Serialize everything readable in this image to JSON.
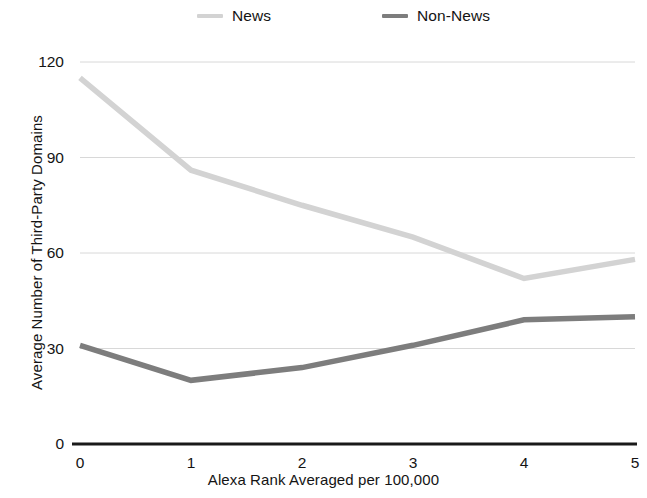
{
  "chart_data": {
    "type": "line",
    "title": "",
    "xlabel": "Alexa Rank Averaged per 100,000",
    "ylabel": "Average Number of Third-Party Domains",
    "x": [
      0,
      1,
      2,
      3,
      4,
      5
    ],
    "xticklabels": [
      "0",
      "1",
      "2",
      "3",
      "4",
      "5"
    ],
    "yticks": [
      0,
      30,
      60,
      90,
      120
    ],
    "yticklabels": [
      "0",
      "30",
      "60",
      "90",
      "120"
    ],
    "xlim": [
      0,
      5
    ],
    "ylim": [
      0,
      120
    ],
    "grid": true,
    "legend_position": "top",
    "series": [
      {
        "name": "News",
        "color": "#d3d3d3",
        "values": [
          115,
          86,
          75,
          65,
          52,
          58
        ]
      },
      {
        "name": "Non-News",
        "color": "#7d7d7d",
        "values": [
          31,
          20,
          24,
          31,
          39,
          40
        ]
      }
    ]
  },
  "legend": {
    "items": [
      {
        "label": "News",
        "color": "#d3d3d3"
      },
      {
        "label": "Non-News",
        "color": "#7d7d7d"
      }
    ]
  },
  "axes": {
    "x_title": "Alexa Rank Averaged per 100,000",
    "y_title": "Average Number of Third-Party Domains"
  },
  "colors": {
    "news": "#d3d3d3",
    "non_news": "#7d7d7d",
    "gridline": "#d8d8d8",
    "baseline": "#1a1a1a",
    "text": "#141414",
    "background": "#ffffff"
  }
}
